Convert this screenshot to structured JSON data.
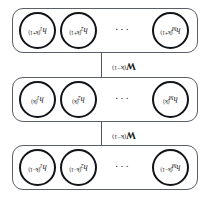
{
  "figure": {
    "type": "layered-network-diagram",
    "orientation_note": "rendered-rotated-180-degrees",
    "ellipsis": "···",
    "layers": [
      {
        "id": "layer-k-minus-1",
        "superscript": "(k−1)",
        "nodes": [
          {
            "base": "h",
            "sub": "M",
            "sup": "(k−1)"
          },
          {
            "base": "h",
            "sub": "2",
            "sup": "(k−1)"
          },
          {
            "base": "h",
            "sub": "1",
            "sup": "(k−1)"
          }
        ]
      },
      {
        "id": "layer-k",
        "superscript": "(k)",
        "nodes": [
          {
            "base": "h",
            "sub": "M",
            "sup": "(k)"
          },
          {
            "base": "h",
            "sub": "2",
            "sup": "(k)"
          },
          {
            "base": "h",
            "sub": "1",
            "sup": "(k)"
          }
        ]
      },
      {
        "id": "layer-k-plus-1",
        "superscript": "(k+1)",
        "nodes": [
          {
            "base": "h",
            "sub": "M",
            "sup": "(k+1)"
          },
          {
            "base": "h",
            "sub": "2",
            "sup": "(k+1)"
          },
          {
            "base": "h",
            "sub": "1",
            "sup": "(k+1)"
          }
        ]
      }
    ],
    "connectors": [
      {
        "id": "weights-upper",
        "matrix": "W",
        "sup": "(k−1)"
      },
      {
        "id": "weights-lower",
        "matrix": "W",
        "sup": "(k−1)"
      }
    ],
    "colors": {
      "node_stroke": "#111418",
      "box_stroke": "#5a5f66",
      "connector": "#4f545b",
      "text": "#1a1a1a",
      "background": "#ffffff"
    }
  }
}
